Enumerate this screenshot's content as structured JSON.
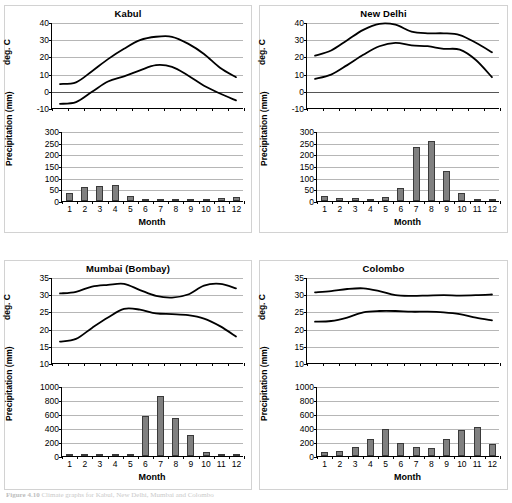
{
  "figure": {
    "caption_label": "Figure 4.10",
    "caption_text": "Climate graphs for Kabul, New Delhi, Mumbai and Colombo"
  },
  "axis_titles": {
    "temp_y": "deg. C",
    "precip_y": "Precipitation (mm)",
    "month_x": "Month"
  },
  "months": [
    "1",
    "2",
    "3",
    "4",
    "5",
    "6",
    "7",
    "8",
    "9",
    "10",
    "11",
    "12"
  ],
  "chart_data": [
    {
      "type": "line",
      "id": "kabul-temperature",
      "title": "Kabul",
      "xlabel": "",
      "ylabel": "deg. C",
      "ylim": [
        -10,
        40
      ],
      "yticks": [
        -10,
        0,
        10,
        20,
        30,
        40
      ],
      "ytick_labels": [
        "-10",
        "0",
        "10",
        "20",
        "30",
        "40"
      ],
      "grid": true,
      "x": [
        1,
        2,
        3,
        4,
        5,
        6,
        7,
        8,
        9,
        10,
        11,
        12
      ],
      "series": [
        {
          "name": "mean daily maximum",
          "values": [
            4.5,
            5.5,
            12,
            19,
            25,
            30,
            32,
            32,
            28,
            22,
            14,
            8.5
          ]
        },
        {
          "name": "mean daily minimum",
          "values": [
            -7,
            -6,
            0,
            6,
            9,
            12.5,
            15.5,
            14.5,
            9.5,
            3.5,
            -1,
            -5
          ]
        }
      ]
    },
    {
      "type": "bar",
      "id": "kabul-precipitation",
      "title": "",
      "xlabel": "Month",
      "ylabel": "Precipitation (mm)",
      "ylim": [
        0,
        300
      ],
      "yticks": [
        0,
        50,
        100,
        150,
        200,
        250,
        300
      ],
      "ytick_labels": [
        "0",
        "50",
        "100",
        "150",
        "200",
        "250",
        "300"
      ],
      "grid": true,
      "categories": [
        "1",
        "2",
        "3",
        "4",
        "5",
        "6",
        "7",
        "8",
        "9",
        "10",
        "11",
        "12"
      ],
      "values": [
        33,
        58,
        64,
        70,
        20,
        1,
        4,
        1,
        1,
        2,
        14,
        16
      ]
    },
    {
      "type": "line",
      "id": "new-delhi-temperature",
      "title": "New Delhi",
      "xlabel": "",
      "ylabel": "deg. C",
      "ylim": [
        -10,
        40
      ],
      "yticks": [
        -10,
        0,
        10,
        20,
        30,
        40
      ],
      "ytick_labels": [
        "-10",
        "0",
        "10",
        "20",
        "30",
        "40"
      ],
      "grid": true,
      "x": [
        1,
        2,
        3,
        4,
        5,
        6,
        7,
        8,
        9,
        10,
        11,
        12
      ],
      "series": [
        {
          "name": "mean daily maximum",
          "values": [
            21,
            24,
            30,
            36,
            39.5,
            39,
            35,
            34,
            34,
            33,
            28.5,
            23
          ]
        },
        {
          "name": "mean daily minimum",
          "values": [
            7.5,
            10,
            15.5,
            21.5,
            26.5,
            28.5,
            27,
            26.5,
            25,
            24.5,
            18.5,
            8.5
          ]
        }
      ]
    },
    {
      "type": "bar",
      "id": "new-delhi-precipitation",
      "title": "",
      "xlabel": "Month",
      "ylabel": "Precipitation (mm)",
      "ylim": [
        0,
        300
      ],
      "yticks": [
        0,
        50,
        100,
        150,
        200,
        250,
        300
      ],
      "ytick_labels": [
        "0",
        "50",
        "100",
        "150",
        "200",
        "250",
        "300"
      ],
      "grid": true,
      "categories": [
        "1",
        "2",
        "3",
        "4",
        "5",
        "6",
        "7",
        "8",
        "9",
        "10",
        "11",
        "12"
      ],
      "values": [
        20,
        15,
        15,
        7,
        17,
        55,
        230,
        257,
        128,
        35,
        3,
        8
      ]
    },
    {
      "type": "line",
      "id": "mumbai-temperature",
      "title": "Mumbai (Bombay)",
      "xlabel": "",
      "ylabel": "deg. C",
      "ylim": [
        10,
        35
      ],
      "yticks": [
        10,
        15,
        20,
        25,
        30,
        35
      ],
      "ytick_labels": [
        "10",
        "15",
        "20",
        "25",
        "30",
        "35"
      ],
      "grid": true,
      "x": [
        1,
        2,
        3,
        4,
        5,
        6,
        7,
        8,
        9,
        10,
        11,
        12
      ],
      "series": [
        {
          "name": "mean daily maximum",
          "values": [
            30.5,
            31,
            32.5,
            33,
            33.3,
            31.5,
            29.8,
            29.3,
            30.2,
            32.8,
            33.3,
            32
          ]
        },
        {
          "name": "mean daily minimum",
          "values": [
            16.5,
            17.3,
            20.5,
            23.5,
            26,
            25.8,
            24.7,
            24.5,
            24.2,
            23.2,
            21,
            18
          ]
        }
      ]
    },
    {
      "type": "bar",
      "id": "mumbai-precipitation",
      "title": "",
      "xlabel": "Month",
      "ylabel": "Precipitation (mm)",
      "ylim": [
        0,
        1000
      ],
      "yticks": [
        0,
        200,
        400,
        600,
        800,
        1000
      ],
      "ytick_labels": [
        "0",
        "200",
        "400",
        "600",
        "800",
        "1000"
      ],
      "grid": true,
      "categories": [
        "1",
        "2",
        "3",
        "4",
        "5",
        "6",
        "7",
        "8",
        "9",
        "10",
        "11",
        "12"
      ],
      "values": [
        1,
        7,
        1,
        1,
        15,
        565,
        860,
        550,
        300,
        55,
        12,
        5
      ]
    },
    {
      "type": "line",
      "id": "colombo-temperature",
      "title": "Colombo",
      "xlabel": "",
      "ylabel": "deg. C",
      "ylim": [
        10,
        35
      ],
      "yticks": [
        10,
        15,
        20,
        25,
        30,
        35
      ],
      "ytick_labels": [
        "10",
        "15",
        "20",
        "25",
        "30",
        "35"
      ],
      "grid": true,
      "x": [
        1,
        2,
        3,
        4,
        5,
        6,
        7,
        8,
        9,
        10,
        11,
        12
      ],
      "series": [
        {
          "name": "mean daily maximum",
          "values": [
            30.8,
            31.2,
            31.8,
            32,
            31.2,
            30,
            29.8,
            29.9,
            30,
            29.9,
            30,
            30.2
          ]
        },
        {
          "name": "mean daily minimum",
          "values": [
            22.3,
            22.5,
            23.5,
            25,
            25.4,
            25.4,
            25.2,
            25.2,
            25,
            24.5,
            23.5,
            22.7
          ]
        }
      ]
    },
    {
      "type": "bar",
      "id": "colombo-precipitation",
      "title": "",
      "xlabel": "Month",
      "ylabel": "Precipitation (mm)",
      "ylim": [
        0,
        1000
      ],
      "yticks": [
        0,
        200,
        400,
        600,
        800,
        1000
      ],
      "ytick_labels": [
        "0",
        "200",
        "400",
        "600",
        "800",
        "1000"
      ],
      "grid": true,
      "categories": [
        "1",
        "2",
        "3",
        "4",
        "5",
        "6",
        "7",
        "8",
        "9",
        "10",
        "11",
        "12"
      ],
      "values": [
        55,
        75,
        125,
        245,
        390,
        180,
        125,
        115,
        245,
        365,
        410,
        170
      ]
    }
  ],
  "colors": {
    "bar_fill": "#808080",
    "bar_stroke": "#3a3a3a",
    "line": "#000000",
    "grid": "#b6b6b6",
    "panel_border": "#d2d2d2"
  }
}
